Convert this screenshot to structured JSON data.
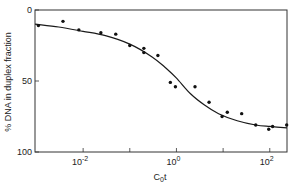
{
  "chart_data": {
    "type": "scatter",
    "title": "",
    "xlabel": "C0t",
    "xlabel_main": "C",
    "xlabel_sub": "0",
    "xlabel_tail": "t",
    "ylabel": "% DNA in duplex fraction",
    "xscale": "log",
    "xlim": [
      0.00093,
      234
    ],
    "ylim": [
      0,
      100
    ],
    "y_inverted": true,
    "grid": false,
    "legend": null,
    "x_ticks": [
      {
        "value": 0.01,
        "base": "10",
        "exp": "-2",
        "labeled": true
      },
      {
        "value": 0.1,
        "labeled": false
      },
      {
        "value": 1,
        "base": "10",
        "exp": "0",
        "labeled": true
      },
      {
        "value": 10,
        "labeled": false
      },
      {
        "value": 100,
        "base": "10",
        "exp": "2",
        "labeled": true
      }
    ],
    "y_ticks": [
      {
        "value": 0,
        "label": "0"
      },
      {
        "value": 50,
        "label": "50"
      },
      {
        "value": 100,
        "label": "100"
      }
    ],
    "series": [
      {
        "name": "measured",
        "style": "points",
        "points": [
          {
            "x": 0.0011,
            "y": 11
          },
          {
            "x": 0.0037,
            "y": 8
          },
          {
            "x": 0.0081,
            "y": 14
          },
          {
            "x": 0.024,
            "y": 16
          },
          {
            "x": 0.05,
            "y": 17
          },
          {
            "x": 0.1,
            "y": 25
          },
          {
            "x": 0.2,
            "y": 27
          },
          {
            "x": 0.2,
            "y": 30
          },
          {
            "x": 0.4,
            "y": 32
          },
          {
            "x": 0.74,
            "y": 51
          },
          {
            "x": 0.95,
            "y": 54
          },
          {
            "x": 2.5,
            "y": 54
          },
          {
            "x": 5.0,
            "y": 65
          },
          {
            "x": 9.5,
            "y": 75
          },
          {
            "x": 12.3,
            "y": 72
          },
          {
            "x": 25,
            "y": 73
          },
          {
            "x": 50,
            "y": 81
          },
          {
            "x": 95,
            "y": 84
          },
          {
            "x": 115,
            "y": 82
          },
          {
            "x": 230,
            "y": 81
          }
        ]
      },
      {
        "name": "fit",
        "style": "line",
        "points": [
          {
            "x": 0.00093,
            "y": 10
          },
          {
            "x": 0.003,
            "y": 12
          },
          {
            "x": 0.01,
            "y": 15
          },
          {
            "x": 0.03,
            "y": 18
          },
          {
            "x": 0.1,
            "y": 24
          },
          {
            "x": 0.3,
            "y": 33
          },
          {
            "x": 0.6,
            "y": 41
          },
          {
            "x": 1,
            "y": 48
          },
          {
            "x": 2,
            "y": 59
          },
          {
            "x": 4,
            "y": 67
          },
          {
            "x": 8,
            "y": 73
          },
          {
            "x": 20,
            "y": 78
          },
          {
            "x": 50,
            "y": 81
          },
          {
            "x": 100,
            "y": 82
          },
          {
            "x": 234,
            "y": 83
          }
        ]
      }
    ]
  },
  "style": {
    "ink": "#1a1a1a",
    "frame": "#333333",
    "background": "#ffffff"
  }
}
